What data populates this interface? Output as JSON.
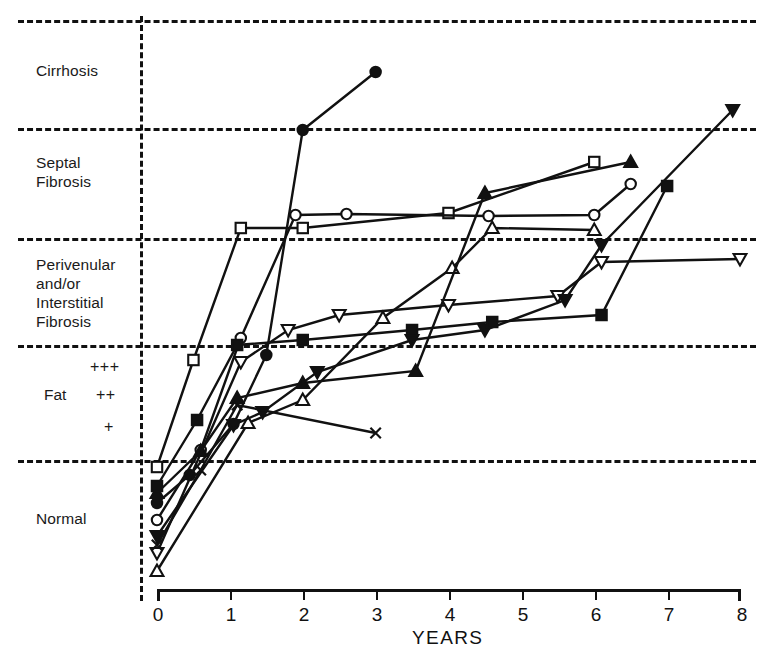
{
  "chart_data": {
    "type": "line",
    "title": "",
    "xlabel": "YEARS",
    "ylabel": "",
    "xlim": [
      0,
      8
    ],
    "xticks": [
      "0",
      "1",
      "2",
      "3",
      "4",
      "5",
      "6",
      "7",
      "8"
    ],
    "grid": true,
    "legend": "none",
    "y_axis_kind": "ordinal-bands",
    "y_bands": [
      {
        "name": "Cirrhosis",
        "label_lines": [
          "Cirrhosis"
        ],
        "top": 20,
        "bottom": 128
      },
      {
        "name": "Septal Fibrosis",
        "label_lines": [
          "Septal",
          "Fibrosis"
        ],
        "top": 128,
        "bottom": 238
      },
      {
        "name": "Perivenular and/or Interstitial Fibrosis",
        "label_lines": [
          "Perivenular",
          "and/or",
          "Interstitial",
          "Fibrosis"
        ],
        "top": 238,
        "bottom": 345
      },
      {
        "name": "Fat",
        "label_lines": [
          "Fat"
        ],
        "sublabels": [
          "+++",
          "++",
          "+"
        ],
        "top": 345,
        "bottom": 460
      },
      {
        "name": "Normal",
        "label_lines": [
          "Normal"
        ],
        "top": 460,
        "bottom": 590
      }
    ],
    "series": [
      {
        "name": "filled-circle",
        "marker": "circle-filled",
        "points": [
          [
            0,
            503
          ],
          [
            0.45,
            475
          ],
          [
            1.05,
            424
          ],
          [
            1.5,
            355
          ],
          [
            2,
            130
          ],
          [
            3,
            72
          ]
        ]
      },
      {
        "name": "open-square-a",
        "marker": "square-open",
        "points": [
          [
            0,
            467
          ],
          [
            0.5,
            360
          ],
          [
            1.15,
            228
          ],
          [
            2,
            228
          ],
          [
            4,
            213
          ],
          [
            6,
            162
          ]
        ]
      },
      {
        "name": "open-circle",
        "marker": "circle-open",
        "points": [
          [
            0,
            520
          ],
          [
            0.6,
            450
          ],
          [
            1.15,
            338
          ],
          [
            1.9,
            215
          ],
          [
            2.6,
            214
          ],
          [
            4.55,
            216
          ],
          [
            6,
            215
          ],
          [
            6.5,
            184
          ]
        ]
      },
      {
        "name": "open-up-triangle",
        "marker": "triangle-up-open",
        "points": [
          [
            0,
            571
          ],
          [
            1.25,
            423
          ],
          [
            2.0,
            400
          ],
          [
            3.1,
            318
          ],
          [
            4.05,
            268
          ],
          [
            4.6,
            228
          ],
          [
            6,
            230
          ]
        ]
      },
      {
        "name": "filled-up-triangle",
        "marker": "triangle-up-filled",
        "points": [
          [
            0,
            493
          ],
          [
            0.6,
            451
          ],
          [
            1.1,
            398
          ],
          [
            2.0,
            383
          ],
          [
            3.55,
            371
          ],
          [
            4.5,
            193
          ],
          [
            6.5,
            162
          ]
        ]
      },
      {
        "name": "open-down-triangle",
        "marker": "triangle-down-open",
        "points": [
          [
            0,
            553
          ],
          [
            1.15,
            362
          ],
          [
            1.8,
            330
          ],
          [
            2.5,
            315
          ],
          [
            4.0,
            305
          ],
          [
            5.5,
            296
          ],
          [
            6.1,
            262
          ],
          [
            8,
            259
          ]
        ]
      },
      {
        "name": "filled-down-triangle",
        "marker": "triangle-down-filled",
        "points": [
          [
            0,
            536
          ],
          [
            1.05,
            425
          ],
          [
            1.45,
            412
          ],
          [
            2.2,
            372
          ],
          [
            3.5,
            340
          ],
          [
            4.5,
            330
          ],
          [
            5.6,
            300
          ],
          [
            6.1,
            245
          ],
          [
            7.9,
            110
          ]
        ]
      },
      {
        "name": "filled-square",
        "marker": "square-filled",
        "points": [
          [
            0,
            486
          ],
          [
            0.55,
            420
          ],
          [
            1.1,
            345
          ],
          [
            2.0,
            340
          ],
          [
            3.5,
            330
          ],
          [
            4.6,
            322
          ],
          [
            6.1,
            315
          ],
          [
            7,
            186
          ]
        ]
      },
      {
        "name": "x-mark",
        "marker": "x",
        "points": [
          [
            0,
            545
          ],
          [
            0.6,
            470
          ],
          [
            1.1,
            405
          ],
          [
            3.0,
            433
          ]
        ]
      }
    ]
  },
  "axis": {
    "x_title": "YEARS",
    "x_tick_labels": [
      "0",
      "1",
      "2",
      "3",
      "4",
      "5",
      "6",
      "7",
      "8"
    ]
  },
  "y_labels": {
    "cirrhosis": "Cirrhosis",
    "septal_line1": "Septal",
    "septal_line2": "Fibrosis",
    "perivenular_line1": "Perivenular",
    "perivenular_line2": "and/or",
    "perivenular_line3": "Interstitial",
    "perivenular_line4": "Fibrosis",
    "fat": "Fat",
    "fat_plus3": "+++",
    "fat_plus2": "++",
    "fat_plus1": "+",
    "normal": "Normal"
  },
  "colors": {
    "ink": "#111111",
    "background": "#ffffff"
  }
}
